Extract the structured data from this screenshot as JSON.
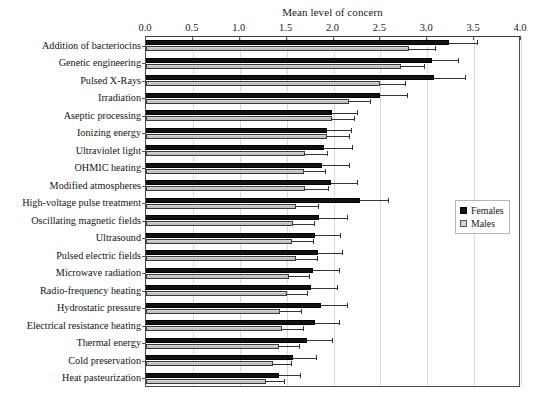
{
  "chart_data": {
    "type": "bar",
    "orientation": "horizontal",
    "title": "Mean level of concern",
    "xlabel": "Mean level of concern",
    "ylabel": "",
    "xlim": [
      0.0,
      4.0
    ],
    "xticks": [
      "0.0",
      "0.5",
      "1.0",
      "1.5",
      "2.0",
      "2.5",
      "3.0",
      "3.5",
      "4.0"
    ],
    "xtick_values": [
      0.0,
      0.5,
      1.0,
      1.5,
      2.0,
      2.5,
      3.0,
      3.5,
      4.0
    ],
    "grid": true,
    "grid_axis": "x",
    "legend_position": "right-middle",
    "categories": [
      "Addition of bacteriocins",
      "Genetic engineering",
      "Pulsed X-Rays",
      "Irradiation",
      "Aseptic processing",
      "Ionizing energy",
      "Ultraviolet light",
      "OHMIC heating",
      "Modified atmospheres",
      "High-voltage pulse treatment",
      "Oscillating magnetic fields",
      "Ultrasound",
      "Pulsed electric fields",
      "Microwave radiation",
      "Radio-frequency heating",
      "Hydrostatic pressure",
      "Electrical resistance heating",
      "Thermal energy",
      "Cold preservation",
      "Heat pasteurization"
    ],
    "series": [
      {
        "name": "Females",
        "color": "#121212",
        "values": [
          3.23,
          3.05,
          3.07,
          2.5,
          1.98,
          1.93,
          1.9,
          1.88,
          1.97,
          2.28,
          1.85,
          1.8,
          1.83,
          1.78,
          1.76,
          1.87,
          1.8,
          1.72,
          1.57,
          1.42
        ],
        "errors": [
          0.3,
          0.28,
          0.33,
          0.28,
          0.27,
          0.26,
          0.3,
          0.28,
          0.28,
          0.3,
          0.29,
          0.27,
          0.26,
          0.28,
          0.28,
          0.27,
          0.26,
          0.26,
          0.24,
          0.22
        ]
      },
      {
        "name": "Males",
        "color": "#c9c9c9",
        "values": [
          2.8,
          2.72,
          2.5,
          2.16,
          1.98,
          1.93,
          1.7,
          1.68,
          1.7,
          1.6,
          1.57,
          1.56,
          1.6,
          1.52,
          1.5,
          1.43,
          1.45,
          1.42,
          1.35,
          1.28
        ],
        "errors": [
          0.28,
          0.25,
          0.26,
          0.23,
          0.24,
          0.24,
          0.23,
          0.23,
          0.24,
          0.23,
          0.22,
          0.22,
          0.22,
          0.22,
          0.22,
          0.22,
          0.22,
          0.21,
          0.2,
          0.19
        ]
      }
    ]
  },
  "legend": {
    "items": [
      {
        "label": "Females",
        "marker": "filled-square-dark"
      },
      {
        "label": "Males",
        "marker": "filled-square-light"
      }
    ]
  }
}
